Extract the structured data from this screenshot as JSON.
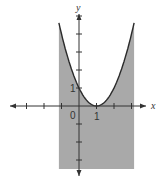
{
  "chart_data": {
    "type": "line",
    "title": "",
    "function": "y = (x - 1)^2",
    "xlabel": "x",
    "ylabel": "y",
    "origin_label": "0",
    "x_tick_labels": [
      {
        "value": 1,
        "label": "1"
      }
    ],
    "y_tick_labels": [
      {
        "value": 1,
        "label": "1"
      }
    ],
    "x_ticks": [
      -3,
      -2,
      -1,
      1,
      2,
      3
    ],
    "y_ticks": [
      -3,
      -2,
      -1,
      1,
      2,
      3,
      4,
      5
    ],
    "xlim": [
      -3.0,
      3.4
    ],
    "ylim": [
      -3.9,
      5.5
    ],
    "shaded_region": {
      "x_from": -1.15,
      "x_to": 3.15,
      "y_bottom": -3.5,
      "description": "area below curve down to y=-3.5 between vertical bounds"
    },
    "curve_points": [
      {
        "x": -1.2,
        "y": 4.84
      },
      {
        "x": -1.0,
        "y": 4.0
      },
      {
        "x": -0.5,
        "y": 2.25
      },
      {
        "x": 0,
        "y": 1
      },
      {
        "x": 0.5,
        "y": 0.25
      },
      {
        "x": 1,
        "y": 0
      },
      {
        "x": 1.5,
        "y": 0.25
      },
      {
        "x": 2,
        "y": 1
      },
      {
        "x": 2.5,
        "y": 2.25
      },
      {
        "x": 3,
        "y": 4
      },
      {
        "x": 3.2,
        "y": 4.84
      }
    ],
    "grid": false,
    "colors": {
      "shade": "#a9a9a9",
      "curve": "#2b2b2b",
      "axis": "#333333",
      "background": "#ffffff"
    }
  }
}
